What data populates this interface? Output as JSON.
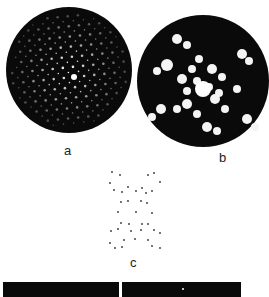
{
  "figure": {
    "panels": [
      {
        "id": "a",
        "label": "a",
        "description": "diffraction pattern: dark circular field with lattice of bright spots, bright central spot"
      },
      {
        "id": "b",
        "label": "b",
        "description": "reconstructed image: dark circular field with bright blob-like motifs arranged around a central bright disc"
      },
      {
        "id": "c",
        "label": "c",
        "description": "schematic of dots arranged in an hourglass/X-shaped pattern"
      }
    ],
    "bottom_strips": [
      {
        "id": "strip-left",
        "description": "dark image strip (cropped)"
      },
      {
        "id": "strip-right",
        "description": "dark image strip with small bright spot (cropped)"
      }
    ],
    "colors": {
      "background": "#ffffff",
      "field": "#0a0a0a",
      "spot": "#ffffff",
      "schematic_dot": "#333333",
      "label": "#222222"
    }
  }
}
